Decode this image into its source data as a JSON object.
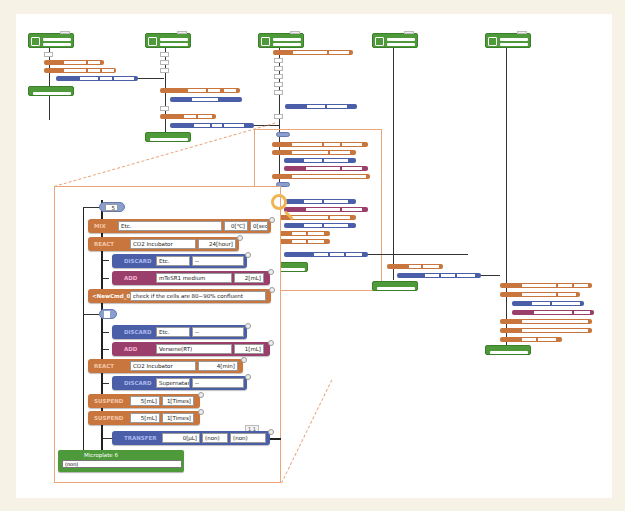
{
  "overview": {
    "containers": [
      {
        "name": "Container",
        "fields": [
          "Cells",
          "Culture dish"
        ]
      },
      {
        "name": "Tube",
        "fields": [
          "culture medium",
          ""
        ]
      },
      {
        "name": "Microplate",
        "fields": [
          "Multiwell plate",
          ""
        ]
      },
      {
        "name": "Tube",
        "fields": [
          "reagent",
          ""
        ]
      },
      {
        "name": "Microplate",
        "fields": [
          "Multiwell plate",
          ""
        ]
      }
    ]
  },
  "zoom_panel": {
    "loop1": {
      "count": "5"
    },
    "rows": [
      {
        "op": "MIX",
        "fields": [
          "Etc.",
          "0[℃]",
          "0[sec]"
        ]
      },
      {
        "op": "REACT",
        "fields": [
          "CO2 Incubator",
          "24[hour]"
        ]
      },
      {
        "op": "DISCARD",
        "fields": [
          "Etc.",
          "--"
        ]
      },
      {
        "op": "ADD",
        "fields": [
          "mTeSR1 medium",
          "2[mL]"
        ]
      },
      {
        "op": "<NewCmd_0",
        "fields": [
          "check if the cells are 80~90% confluent"
        ]
      },
      {
        "op": "DISCARD",
        "fields": [
          "Etc.",
          "--"
        ]
      },
      {
        "op": "ADD",
        "fields": [
          "Versene(RT)",
          "1[mL]"
        ]
      },
      {
        "op": "REACT",
        "fields": [
          "CO2 Incubator",
          "4[min]"
        ]
      },
      {
        "op": "DISCARD",
        "fields": [
          "Supernatant",
          "--"
        ]
      },
      {
        "op": "SUSPEND",
        "fields": [
          "5[mL]",
          "1[Times]"
        ]
      },
      {
        "op": "SUSPEND",
        "fields": [
          "5[mL]",
          "1[Times]"
        ]
      },
      {
        "op": "TRANSFER",
        "fields": [
          "0[µL]",
          "(non)",
          "(non)"
        ]
      }
    ],
    "transfer_counter": "1 1",
    "output": {
      "name": "Microplate 6",
      "value": "(non)"
    }
  },
  "colors": {
    "container": "#4e9a3a",
    "orange_op": "#c8763e",
    "blue_op": "#4a5fa8",
    "purple_op": "#9a3f6c",
    "zoom_outline": "#e9a67a",
    "magnifier": "#f0b553"
  },
  "icons": [
    "magnifier-icon"
  ]
}
